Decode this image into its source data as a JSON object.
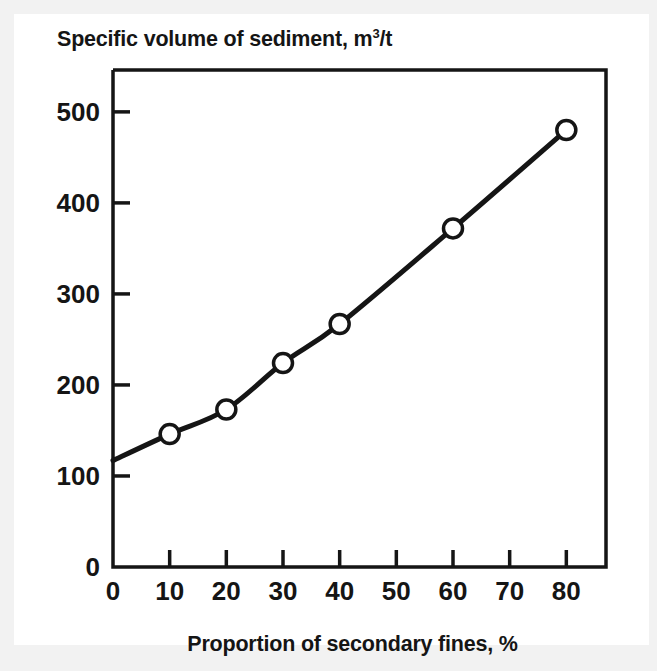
{
  "chart_data": {
    "type": "line",
    "title": "Specific volume of sediment, m3/t",
    "title_main": "Specific volume of sediment, m",
    "title_sup": "3",
    "title_tail": "/t",
    "xlabel": "Proportion of secondary fines, %",
    "ylabel": "Specific volume of sediment, m3/t",
    "xlim": [
      0,
      87
    ],
    "ylim": [
      0,
      546
    ],
    "grid": false,
    "legend": null,
    "xticks": [
      0,
      10,
      20,
      30,
      40,
      50,
      60,
      70,
      80
    ],
    "xtick_labels": [
      "0",
      "10",
      "20",
      "30",
      "40",
      "50",
      "60",
      "70",
      "80"
    ],
    "yticks": [
      0,
      100,
      200,
      300,
      400,
      500
    ],
    "ytick_labels": [
      "0",
      "100",
      "200",
      "300",
      "400",
      "500"
    ],
    "marker": "open-circle",
    "line_color": "#151515",
    "marker_face_color": "#ffffff",
    "x": [
      0,
      10,
      20,
      30,
      40,
      60,
      80
    ],
    "y": [
      117,
      146,
      173,
      224,
      267,
      372,
      480
    ],
    "series": [
      {
        "name": "Specific volume of sediment",
        "points": [
          {
            "x": 0,
            "y": 117,
            "marker": false
          },
          {
            "x": 10,
            "y": 146,
            "marker": true
          },
          {
            "x": 20,
            "y": 173,
            "marker": true
          },
          {
            "x": 30,
            "y": 224,
            "marker": true
          },
          {
            "x": 40,
            "y": 267,
            "marker": true
          },
          {
            "x": 60,
            "y": 372,
            "marker": true
          },
          {
            "x": 80,
            "y": 480,
            "marker": true
          }
        ]
      }
    ]
  },
  "axes": {
    "x_label": "Proportion of secondary fines, %",
    "y_label_full": "Specific volume of sediment, m3/t"
  }
}
